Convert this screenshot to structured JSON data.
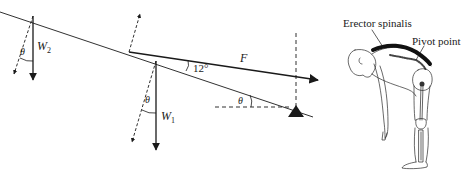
{
  "diagram": {
    "type": "free-body-diagram",
    "labels": {
      "w2": "W",
      "w2_sub": "2",
      "w1": "W",
      "w1_sub": "1",
      "force": "F",
      "angle_f": "12°",
      "theta": "θ"
    },
    "forces": [
      {
        "name": "W2",
        "direction": "vertical-down",
        "component": "dashed at angle θ"
      },
      {
        "name": "W1",
        "direction": "vertical-down",
        "component": "dashed at angle θ"
      },
      {
        "name": "F",
        "direction": "along 12° from beam"
      },
      {
        "name": "normal-reaction",
        "direction": "perpendicular to beam, dashed"
      }
    ],
    "angles": [
      "θ",
      "12°",
      "θ",
      "θ"
    ],
    "pivot": "filled triangle support"
  },
  "illustration": {
    "labels": {
      "muscle": "Erector spinalis",
      "pivot": "Pivot point"
    }
  },
  "colors": {
    "ink": "#1a1a1a",
    "background": "#ffffff",
    "muscle": "#222222"
  }
}
